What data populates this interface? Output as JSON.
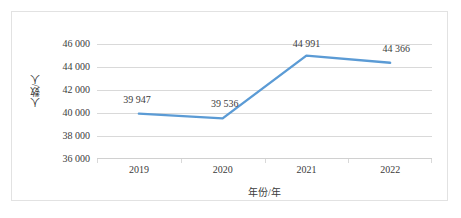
{
  "chart_data": {
    "type": "line",
    "title": "",
    "xlabel": "年份/年",
    "ylabel": "人数/人",
    "categories": [
      "2019",
      "2020",
      "2021",
      "2022"
    ],
    "values": [
      39947,
      39536,
      44991,
      44366
    ],
    "data_labels": [
      "39 947",
      "39 536",
      "44 991",
      "44 366"
    ],
    "yticks": [
      "46 000",
      "44 000",
      "42 000",
      "40 000",
      "38 000",
      "36 000"
    ],
    "ytick_values": [
      46000,
      44000,
      42000,
      40000,
      38000,
      36000
    ],
    "ylim": [
      36000,
      46000
    ],
    "grid": "horizontal",
    "legend": "none",
    "series": [
      {
        "name": "人数",
        "values": [
          39947,
          39536,
          44991,
          44366
        ],
        "color": "#5B9BD5"
      }
    ],
    "colors": {
      "line": "#5B9BD5",
      "gridline": "#d9d9d9",
      "text": "#3b3b3b",
      "border": "#e2e2e2",
      "background": "#ffffff"
    }
  }
}
